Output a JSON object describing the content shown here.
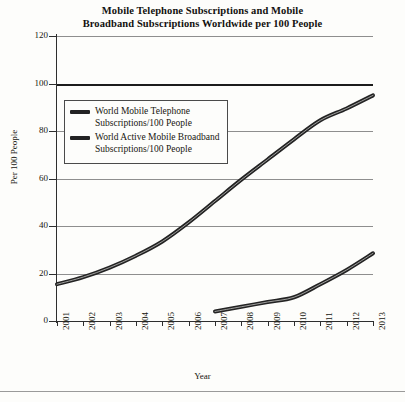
{
  "chart_data": {
    "type": "line",
    "title": "Mobile Telephone Subscriptions and Mobile Broadband Subscriptions Worldwide per 100 People",
    "title_line1": "Mobile Telephone Subscriptions and Mobile",
    "title_line2": "Broadband Subscriptions Worldwide per 100 People",
    "xlabel": "Year",
    "ylabel": "Per 100 People",
    "categories": [
      2001,
      2002,
      2003,
      2004,
      2005,
      2006,
      2007,
      2008,
      2009,
      2010,
      2011,
      2012,
      2013
    ],
    "x_tick_labels": [
      "2001",
      "2002",
      "2003",
      "2004",
      "2005",
      "2006",
      "2007",
      "2008",
      "2009",
      "2010",
      "2011",
      "2012",
      "2013"
    ],
    "y_tick_labels": [
      "0",
      "20",
      "40",
      "60",
      "80",
      "100",
      "120"
    ],
    "y_ticks": [
      0,
      20,
      40,
      60,
      80,
      100,
      120
    ],
    "ylim": [
      0,
      120
    ],
    "xlim": [
      2001,
      2013
    ],
    "grid": "horizontal",
    "emphasized_gridline": 100,
    "legend_position": "upper-left-inside",
    "series": [
      {
        "name": "World Mobile Telephone Subscriptions/100 People",
        "legend_line1": "World Mobile Telephone",
        "legend_line2": "Subscriptions/100 People",
        "color": "#232323",
        "x": [
          2001,
          2002,
          2003,
          2004,
          2005,
          2006,
          2007,
          2008,
          2009,
          2010,
          2011,
          2012,
          2013
        ],
        "values": [
          15.5,
          18.5,
          22.5,
          27.5,
          33.5,
          41.5,
          50.5,
          59.5,
          68.0,
          76.5,
          84.5,
          89.5,
          95.0
        ]
      },
      {
        "name": "World Active Mobile Broadband Subscriptions/100 People",
        "legend_line1": "World Active Mobile Broadband",
        "legend_line2": "Subscriptions/100 People",
        "color": "#232323",
        "x": [
          2007,
          2008,
          2009,
          2010,
          2011,
          2012,
          2013
        ],
        "values": [
          4.0,
          6.0,
          8.0,
          10.0,
          15.5,
          21.5,
          28.5
        ]
      }
    ]
  }
}
